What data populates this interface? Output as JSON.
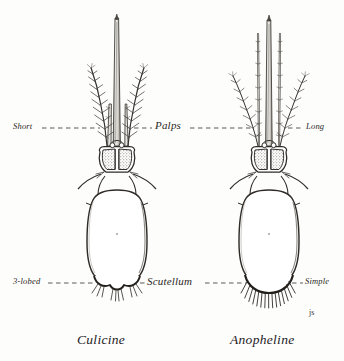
{
  "figure": {
    "background_color": "#fdfdfc",
    "ink_color": "#2a2723",
    "signature": "js"
  },
  "annotations": {
    "palps_row": {
      "left_label": "Short",
      "center_label": "Palps",
      "right_label": "Long"
    },
    "scutellum_row": {
      "left_label": "3-lobed",
      "center_label": "Scutellum",
      "right_label": "Simple"
    }
  },
  "specimens": [
    {
      "caption": "Culicine",
      "side": "left",
      "palps": "Short",
      "scutellum": "3-lobed"
    },
    {
      "caption": "Anopheline",
      "side": "right",
      "palps": "Long",
      "scutellum": "Simple"
    }
  ]
}
